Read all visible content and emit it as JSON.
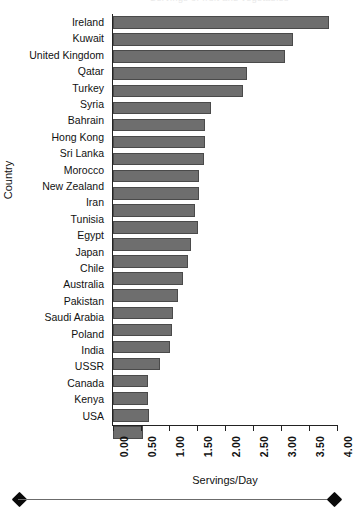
{
  "figure": {
    "title_remnant": "Servings of fruit and vegetables",
    "scalebar": {
      "left_cap": "diamond-cap",
      "right_cap": "diamond-cap"
    }
  },
  "chart_data": {
    "type": "bar",
    "orientation": "horizontal",
    "title": "",
    "xlabel": "Servings/Day",
    "ylabel": "Country",
    "xlim": [
      0.0,
      4.0
    ],
    "xticks": [
      "0.00",
      "0.50",
      "1.00",
      "1.50",
      "2.00",
      "2.50",
      "3.00",
      "3.50",
      "4.00"
    ],
    "xtick_values": [
      0.0,
      0.5,
      1.0,
      1.5,
      2.0,
      2.5,
      3.0,
      3.5,
      4.0
    ],
    "grid": false,
    "legend": null,
    "bar_color": "#6e6e6e",
    "bar_edge_color": "#4a4a4a",
    "categories": [
      "Ireland",
      "Kuwait",
      "United Kingdom",
      "Qatar",
      "Turkey",
      "Syria",
      "Bahrain",
      "Hong Kong",
      "Sri Lanka",
      "Morocco",
      "New Zealand",
      "Iran",
      "Tunisia",
      "Egypt",
      "Japan",
      "Chile",
      "Australia",
      "Pakistan",
      "Saudi Arabia",
      "Poland",
      "India",
      "USSR",
      "Canada",
      "Kenya",
      "USA"
    ],
    "values": [
      3.86,
      3.21,
      3.07,
      2.39,
      2.32,
      1.75,
      1.64,
      1.64,
      1.62,
      1.54,
      1.54,
      1.46,
      1.51,
      1.39,
      1.34,
      1.25,
      1.16,
      1.07,
      1.05,
      1.02,
      0.84,
      0.63,
      0.63,
      0.64,
      0.54
    ]
  }
}
